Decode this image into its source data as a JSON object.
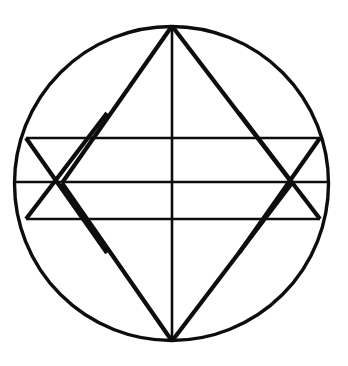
{
  "figure": {
    "background_color": "#ffffff",
    "stroke_color": "#0d0d0d",
    "canvas": {
      "width": 348,
      "height": 366
    },
    "circle": {
      "name": "outer-circle",
      "center_x": 171.5,
      "center_y": 183.5,
      "radius": 157,
      "stroke_width": 3.4
    },
    "points": {
      "top_apex": {
        "x": 172,
        "y": 26
      },
      "bottom_apex": {
        "x": 172,
        "y": 341
      },
      "left_vertex": {
        "x": 62,
        "y": 183
      },
      "right_vertex": {
        "x": 292,
        "y": 183
      },
      "top_chord_left": {
        "x": 26,
        "y": 138
      },
      "top_chord_right": {
        "x": 320,
        "y": 138
      },
      "mid_chord_left": {
        "x": 15,
        "y": 182
      },
      "mid_chord_right": {
        "x": 329,
        "y": 182
      },
      "bottom_chord_left": {
        "x": 26,
        "y": 219
      },
      "bottom_chord_right": {
        "x": 320,
        "y": 219
      }
    },
    "lines": [
      {
        "name": "vertical-diameter",
        "kind": "chord",
        "x1": 172,
        "y1": 26,
        "x2": 172,
        "y2": 341,
        "stroke_width": 2.6
      },
      {
        "name": "horizontal-diameter",
        "kind": "chord",
        "x1": 15,
        "y1": 182,
        "x2": 329,
        "y2": 182,
        "stroke_width": 2.6
      },
      {
        "name": "upper-horizontal-chord",
        "kind": "chord",
        "x1": 26,
        "y1": 138,
        "x2": 320,
        "y2": 138,
        "stroke_width": 2.6
      },
      {
        "name": "lower-horizontal-chord",
        "kind": "chord",
        "x1": 26,
        "y1": 219,
        "x2": 320,
        "y2": 219,
        "stroke_width": 2.6
      },
      {
        "name": "diamond-edge-top-left",
        "kind": "diagonal",
        "x1": 172,
        "y1": 26,
        "x2": 62,
        "y2": 183,
        "stroke_width": 4.2
      },
      {
        "name": "diamond-edge-top-right",
        "kind": "diagonal",
        "x1": 172,
        "y1": 26,
        "x2": 292,
        "y2": 183,
        "stroke_width": 4.2
      },
      {
        "name": "diamond-edge-bottom-left",
        "kind": "diagonal",
        "x1": 62,
        "y1": 183,
        "x2": 172,
        "y2": 341,
        "stroke_width": 4.2
      },
      {
        "name": "diamond-edge-bottom-right",
        "kind": "diagonal",
        "x1": 292,
        "y1": 183,
        "x2": 172,
        "y2": 341,
        "stroke_width": 4.2
      },
      {
        "name": "left-upper-cross-diagonal",
        "kind": "diagonal",
        "x1": 26,
        "y1": 138,
        "x2": 107,
        "y2": 253,
        "stroke_width": 4.2
      },
      {
        "name": "left-lower-cross-diagonal",
        "kind": "diagonal",
        "x1": 26,
        "y1": 219,
        "x2": 107,
        "y2": 113,
        "stroke_width": 4.2
      },
      {
        "name": "right-upper-cross-diagonal",
        "kind": "diagonal",
        "x1": 320,
        "y1": 138,
        "x2": 239,
        "y2": 253,
        "stroke_width": 4.2
      },
      {
        "name": "right-lower-cross-diagonal",
        "kind": "diagonal",
        "x1": 320,
        "y1": 219,
        "x2": 239,
        "y2": 113,
        "stroke_width": 4.2
      }
    ]
  }
}
